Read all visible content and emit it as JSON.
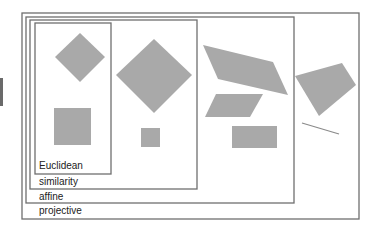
{
  "diagram": {
    "labels": {
      "euclidean": "Euclidean",
      "similarity": "similarity",
      "affine": "affine",
      "projective": "projective"
    },
    "colors": {
      "shape_fill": "#a9a9a9",
      "box_stroke": "#6f6f6f",
      "background": "#ffffff"
    },
    "boxes": [
      {
        "name": "projective",
        "x": 22,
        "y": 13,
        "w": 337,
        "h": 206
      },
      {
        "name": "affine",
        "x": 26,
        "y": 17,
        "w": 268,
        "h": 186
      },
      {
        "name": "similarity",
        "x": 30,
        "y": 20,
        "w": 167,
        "h": 169
      },
      {
        "name": "euclidean",
        "x": 35,
        "y": 23,
        "w": 76,
        "h": 151
      }
    ],
    "shapes": [
      {
        "name": "euclidean-diamond",
        "points": "80,33 105,57 80,82 55,57"
      },
      {
        "name": "euclidean-square",
        "points": "54,108 91,108 91,145 54,145"
      },
      {
        "name": "similarity-large-diamond",
        "points": "154,39 192,75 154,113 116,75"
      },
      {
        "name": "similarity-small-square",
        "points": "141,128 160,128 160,147 141,147"
      },
      {
        "name": "affine-large-parallelogram",
        "points": "203,45 273,62 288,95 218,79"
      },
      {
        "name": "affine-small-parallelogram",
        "points": "216,94 263,94 250,117 205,117"
      },
      {
        "name": "affine-rectangle",
        "points": "232,126 277,126 277,148 232,148"
      },
      {
        "name": "projective-quadrilateral",
        "points": "295,76 342,63 356,85 319,116"
      }
    ],
    "lines": [
      {
        "name": "projective-line-segment",
        "x1": 302,
        "y1": 123,
        "x2": 339,
        "y2": 134
      }
    ]
  }
}
